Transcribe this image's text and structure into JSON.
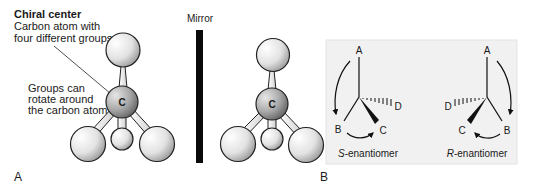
{
  "panel_a": {
    "label": "A",
    "chiral_center": {
      "title": "Chiral center",
      "line1": "Carbon atom with",
      "line2": "four different groups"
    },
    "rotate_note": {
      "line1": "Groups can",
      "line2": "rotate around",
      "line3": "the carbon atom"
    },
    "mirror_label": "Mirror",
    "carbon_symbol": "C"
  },
  "panel_b": {
    "label": "B",
    "s_enantiomer": {
      "italic_prefix": "S",
      "suffix": "-enantiomer",
      "groups": {
        "a": "A",
        "b": "B",
        "c": "C",
        "d": "D"
      }
    },
    "r_enantiomer": {
      "italic_prefix": "R",
      "suffix": "-enantiomer",
      "groups": {
        "a": "A",
        "b": "B",
        "c": "C",
        "d": "D"
      }
    },
    "box_color": "#f1f1f1"
  }
}
